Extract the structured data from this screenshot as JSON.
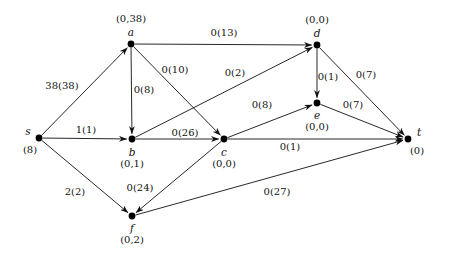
{
  "figure": {
    "kind": "network-flow-graph",
    "background_color": "#ffffff",
    "ink_color": "#111111"
  },
  "nodes": [
    {
      "id": "s",
      "name": "s",
      "value": "(8)",
      "x": 39,
      "y": 138,
      "name_dx": -11,
      "name_dy": -7,
      "value_dx": -9,
      "value_dy": 12
    },
    {
      "id": "a",
      "name": "a",
      "value": "(0,38)",
      "x": 131,
      "y": 44,
      "name_dx": 0,
      "name_dy": -12,
      "value_dx": 0,
      "value_dy": -25
    },
    {
      "id": "b",
      "name": "b",
      "value": "(0,1)",
      "x": 132,
      "y": 139,
      "name_dx": 0,
      "name_dy": 13,
      "value_dx": 0,
      "value_dy": 25
    },
    {
      "id": "c",
      "name": "c",
      "value": "(0,0)",
      "x": 224,
      "y": 139,
      "name_dx": 0,
      "name_dy": 13,
      "value_dx": 0,
      "value_dy": 25
    },
    {
      "id": "d",
      "name": "d",
      "value": "(0,0)",
      "x": 317,
      "y": 45,
      "name_dx": 0,
      "name_dy": -12,
      "value_dx": 0,
      "value_dy": -25
    },
    {
      "id": "e",
      "name": "e",
      "value": "(0,0)",
      "x": 317,
      "y": 103,
      "name_dx": 0,
      "name_dy": 12,
      "value_dx": 0,
      "value_dy": 24
    },
    {
      "id": "f",
      "name": "f",
      "value": "(0,2)",
      "x": 132,
      "y": 216,
      "name_dx": 0,
      "name_dy": 12,
      "value_dx": 0,
      "value_dy": 24
    },
    {
      "id": "t",
      "name": "t",
      "value": "(0)",
      "x": 408,
      "y": 139,
      "name_dx": 11,
      "name_dy": -7,
      "value_dx": 9,
      "value_dy": 12
    }
  ],
  "edges": [
    {
      "id": "s-a",
      "from": "s",
      "to": "a",
      "label": "38(38)",
      "label_x": 62,
      "label_y": 86
    },
    {
      "id": "s-b",
      "from": "s",
      "to": "b",
      "label": "1(1)",
      "label_x": 86,
      "label_y": 130
    },
    {
      "id": "s-f",
      "from": "s",
      "to": "f",
      "label": "2(2)",
      "label_x": 75,
      "label_y": 192
    },
    {
      "id": "a-d",
      "from": "a",
      "to": "d",
      "label": "0(13)",
      "label_x": 224,
      "label_y": 33
    },
    {
      "id": "a-b",
      "from": "a",
      "to": "b",
      "label": "0(8)",
      "label_x": 144,
      "label_y": 90
    },
    {
      "id": "a-c",
      "from": "a",
      "to": "c",
      "label": "0(10)",
      "label_x": 175,
      "label_y": 70
    },
    {
      "id": "b-d",
      "from": "b",
      "to": "d",
      "label": "0(2)",
      "label_x": 235,
      "label_y": 73
    },
    {
      "id": "b-c",
      "from": "b",
      "to": "c",
      "label": "0(26)",
      "label_x": 185,
      "label_y": 133
    },
    {
      "id": "c-e",
      "from": "c",
      "to": "e",
      "label": "0(8)",
      "label_x": 262,
      "label_y": 105
    },
    {
      "id": "c-t",
      "from": "c",
      "to": "t",
      "label": "0(1)",
      "label_x": 290,
      "label_y": 147
    },
    {
      "id": "c-f",
      "from": "c",
      "to": "f",
      "label": "0(24)",
      "label_x": 140,
      "label_y": 188
    },
    {
      "id": "d-e",
      "from": "d",
      "to": "e",
      "label": "0(1)",
      "label_x": 328,
      "label_y": 77
    },
    {
      "id": "d-t",
      "from": "d",
      "to": "t",
      "label": "0(7)",
      "label_x": 366,
      "label_y": 75
    },
    {
      "id": "e-t",
      "from": "e",
      "to": "t",
      "label": "0(7)",
      "label_x": 353,
      "label_y": 105
    },
    {
      "id": "f-t",
      "from": "f",
      "to": "t",
      "label": "0(27)",
      "label_x": 277,
      "label_y": 192
    }
  ]
}
